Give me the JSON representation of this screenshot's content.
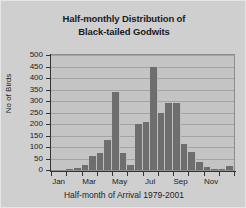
{
  "chart_data": {
    "type": "bar",
    "title": "Half-monthly Distribution of Black-tailed Godwits",
    "title_lines": [
      "Half-monthly Distribution of",
      "Black-tailed Godwits"
    ],
    "xlabel": "Half-month of Arrival 1979-2001",
    "ylabel": "No of Birds",
    "ylim": [
      0,
      500
    ],
    "ytick_values": [
      0,
      50,
      100,
      150,
      200,
      250,
      300,
      350,
      400,
      450,
      500
    ],
    "ytick_labels": [
      "0",
      "50",
      "100",
      "150",
      "200",
      "250",
      "300",
      "350",
      "400",
      "450",
      "500"
    ],
    "grid": true,
    "grid_axis": "y",
    "legend": false,
    "bar_color": "#6e6e6e",
    "plot_bg_color": "#c4c4c4",
    "figure_bg_color": "#cfcfcf",
    "categories": [
      "Jan-1",
      "Jan-2",
      "Feb-1",
      "Feb-2",
      "Mar-1",
      "Mar-2",
      "Apr-1",
      "Apr-2",
      "May-1",
      "May-2",
      "Jun-1",
      "Jun-2",
      "Jul-1",
      "Jul-2",
      "Aug-1",
      "Aug-2",
      "Sep-1",
      "Sep-2",
      "Oct-1",
      "Oct-2",
      "Nov-1",
      "Nov-2",
      "Dec-1",
      "Dec-2"
    ],
    "values": [
      0,
      0,
      3,
      8,
      20,
      60,
      75,
      130,
      340,
      75,
      20,
      200,
      210,
      450,
      250,
      290,
      290,
      115,
      80,
      35,
      12,
      5,
      5,
      18
    ],
    "xtick_labels": [
      "Jan",
      "Mar",
      "May",
      "Jul",
      "Sep",
      "Nov"
    ],
    "xtick_categories": [
      "Jan-1",
      "Mar-1",
      "May-1",
      "Jul-1",
      "Sep-1",
      "Nov-1"
    ]
  }
}
